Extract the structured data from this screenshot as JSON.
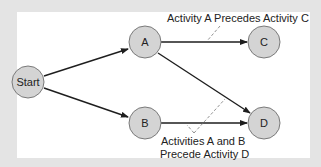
{
  "diagram": {
    "type": "activity-precedence-network",
    "nodes": [
      {
        "id": "start",
        "label": "Start",
        "cx": 28,
        "cy": 82
      },
      {
        "id": "a",
        "label": "A",
        "cx": 145,
        "cy": 42
      },
      {
        "id": "c",
        "label": "C",
        "cx": 264,
        "cy": 42
      },
      {
        "id": "b",
        "label": "B",
        "cx": 145,
        "cy": 123
      },
      {
        "id": "d",
        "label": "D",
        "cx": 264,
        "cy": 123
      }
    ],
    "edges": [
      {
        "from": "start",
        "to": "a"
      },
      {
        "from": "start",
        "to": "b"
      },
      {
        "from": "a",
        "to": "c"
      },
      {
        "from": "a",
        "to": "d"
      },
      {
        "from": "b",
        "to": "d"
      }
    ],
    "annotations": {
      "top": "Activity A Precedes Activity C",
      "bottom_line1": "Activities A and B",
      "bottom_line2": "Precede Activity D"
    },
    "colors": {
      "node_fill": "#d4d4d4",
      "node_stroke": "#7a7a7a",
      "edge": "#1e1e1e",
      "background": "#e4e4e4",
      "panel": "#ffffff"
    }
  }
}
